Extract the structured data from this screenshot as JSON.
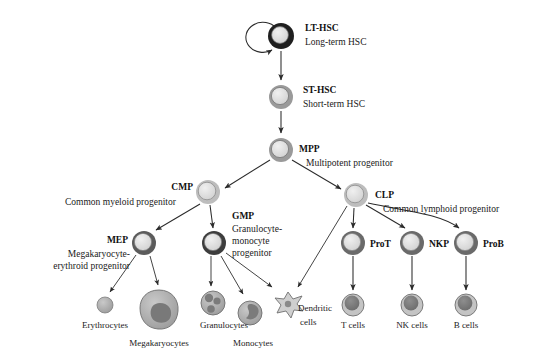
{
  "figure": {
    "background": "#ffffff",
    "line_color": "#2b2b2b"
  },
  "colors": {
    "ring_dark": "#1f1f1f",
    "ring_mid": "#8a8a8a",
    "ring_light": "#b8b8b8",
    "fill_light": "#dcdcdc",
    "fill_mid": "#b0b0b0",
    "nucleus": "#7a7a7a",
    "text": "#111111"
  },
  "nodes": {
    "lt_hsc": {
      "id": "lt-hsc",
      "label": "LT-HSC",
      "sublabel": "Long-term HSC",
      "cx": 281,
      "cy": 36,
      "r": 13,
      "ring": "dark",
      "self_renewal": true
    },
    "st_hsc": {
      "id": "st-hsc",
      "label": "ST-HSC",
      "sublabel": "Short-term HSC",
      "cx": 281,
      "cy": 97,
      "r": 12,
      "ring": "mid"
    },
    "mpp": {
      "id": "mpp",
      "label": "MPP",
      "sublabel": "Multipotent progenitor",
      "cx": 281,
      "cy": 150,
      "r": 12,
      "ring": "mid"
    },
    "cmp": {
      "id": "cmp",
      "label": "CMP",
      "sublabel": "Common myeloid progenitor",
      "cx": 208,
      "cy": 192,
      "r": 12,
      "ring": "light"
    },
    "clp": {
      "id": "clp",
      "label": "CLP",
      "sublabel": "Common lymphoid progenitor",
      "cx": 356,
      "cy": 195,
      "r": 12,
      "ring": "light"
    },
    "mep": {
      "id": "mep",
      "label": "MEP",
      "sublabel": "Megakaryocyte-erythroid progenitor",
      "cx": 144,
      "cy": 243,
      "r": 12,
      "ring": "dark"
    },
    "gmp": {
      "id": "gmp",
      "label": "GMP",
      "sublabel": "Granulocyte-monocyte progenitor",
      "cx": 214,
      "cy": 243,
      "r": 12,
      "ring": "dark"
    },
    "prot": {
      "id": "prot",
      "label": "ProT",
      "cx": 353,
      "cy": 243,
      "r": 12,
      "ring": "dark"
    },
    "nkp": {
      "id": "nkp",
      "label": "NKP",
      "cx": 412,
      "cy": 243,
      "r": 12,
      "ring": "dark"
    },
    "prob": {
      "id": "prob",
      "label": "ProB",
      "cx": 466,
      "cy": 243,
      "r": 12,
      "ring": "dark"
    }
  },
  "terminal_cells": [
    {
      "id": "erythrocytes",
      "label": "Erythrocytes",
      "cx": 105,
      "cy": 305,
      "r": 8,
      "shape": "plain",
      "label_x": 105,
      "label_y": 328
    },
    {
      "id": "megakaryocytes",
      "label": "Megakaryocytes",
      "cx": 159,
      "cy": 309,
      "r": 19,
      "shape": "blob",
      "label_x": 159,
      "label_y": 346
    },
    {
      "id": "granulocytes",
      "label": "Granulocytes",
      "cx": 213,
      "cy": 303,
      "r": 12,
      "shape": "lobed",
      "label_x": 224,
      "label_y": 328
    },
    {
      "id": "monocytes",
      "label": "Monocytes",
      "cx": 250,
      "cy": 313,
      "r": 12,
      "shape": "kidney",
      "label_x": 253,
      "label_y": 346
    },
    {
      "id": "dendritic-cells",
      "label": "Dendritic",
      "label2": "cells",
      "cx": 288,
      "cy": 303,
      "r": 11,
      "shape": "star",
      "label_x": 298,
      "label_y": 311
    },
    {
      "id": "t-cells",
      "label": "T cells",
      "cx": 353,
      "cy": 305,
      "r": 11,
      "shape": "nucleated",
      "label_x": 353,
      "label_y": 328
    },
    {
      "id": "nk-cells",
      "label": "NK cells",
      "cx": 412,
      "cy": 305,
      "r": 11,
      "shape": "nucleated",
      "label_x": 412,
      "label_y": 328
    },
    {
      "id": "b-cells",
      "label": "B cells",
      "cx": 466,
      "cy": 305,
      "r": 11,
      "shape": "nucleated",
      "label_x": 466,
      "label_y": 328
    }
  ],
  "labels": {
    "lt_hsc_x": 305,
    "lt_hsc_y": 31,
    "lt_hsc_sub_y": 45,
    "st_hsc_x": 303,
    "st_hsc_y": 93,
    "st_hsc_sub_y": 107,
    "mpp_x": 299,
    "mpp_y": 152,
    "mpp_sub_x": 306,
    "mpp_sub_y": 166,
    "cmp_x": 193,
    "cmp_y": 190,
    "cmp_sub_x": 185,
    "cmp_sub_y": 205,
    "clp_x": 375,
    "clp_y": 198,
    "clp_sub_x": 383,
    "clp_sub_y": 212,
    "mep_x": 128,
    "mep_y": 243,
    "mep_sub1": "Megakaryocyte-",
    "mep_sub2": "erythroid progenitor",
    "mep_sub_x": 122,
    "mep_sub_y1": 257,
    "mep_sub_y2": 269,
    "gmp_x": 232,
    "gmp_y": 219,
    "gmp_sub1": "Granulocyte-",
    "gmp_sub2": "monocyte",
    "gmp_sub3": "progenitor",
    "gmp_sub_x": 232,
    "gmp_sub_y1": 232,
    "gmp_sub_y2": 244,
    "gmp_sub_y3": 256,
    "prot_x": 370,
    "prot_y": 247,
    "nkp_x": 429,
    "nkp_y": 247,
    "prob_x": 483,
    "prob_y": 247
  },
  "edges": [
    {
      "id": "lt-to-st",
      "from": "lt_hsc",
      "to": "st_hsc"
    },
    {
      "id": "st-to-mpp",
      "from": "st_hsc",
      "to": "mpp"
    },
    {
      "id": "mpp-to-cmp",
      "from": "mpp",
      "to": "cmp"
    },
    {
      "id": "mpp-to-clp",
      "from": "mpp",
      "to": "clp"
    },
    {
      "id": "cmp-to-mep",
      "from": "cmp",
      "to": "mep"
    },
    {
      "id": "cmp-to-gmp",
      "from": "cmp",
      "to": "gmp"
    },
    {
      "id": "mep-to-erythrocytes",
      "from": "mep",
      "to": "erythrocytes"
    },
    {
      "id": "mep-to-megakaryocytes",
      "from": "mep",
      "to": "megakaryocytes"
    },
    {
      "id": "gmp-to-granulocytes",
      "from": "gmp",
      "to": "granulocytes"
    },
    {
      "id": "gmp-to-monocytes",
      "from": "gmp",
      "to": "monocytes"
    },
    {
      "id": "gmp-to-dendritic",
      "from": "gmp",
      "to": "dendritic-cells"
    },
    {
      "id": "clp-to-dendritic",
      "from": "clp",
      "to": "dendritic-cells"
    },
    {
      "id": "clp-to-prot",
      "from": "clp",
      "to": "prot"
    },
    {
      "id": "clp-to-nkp",
      "from": "clp",
      "to": "nkp"
    },
    {
      "id": "clp-to-prob",
      "from": "clp",
      "to": "prob"
    },
    {
      "id": "prot-to-tcells",
      "from": "prot",
      "to": "t-cells"
    },
    {
      "id": "nkp-to-nkcells",
      "from": "nkp",
      "to": "nk-cells"
    },
    {
      "id": "prob-to-bcells",
      "from": "prob",
      "to": "b-cells"
    }
  ]
}
